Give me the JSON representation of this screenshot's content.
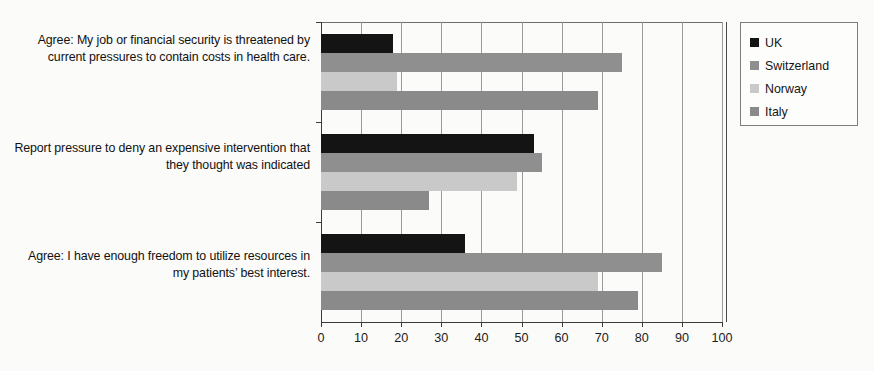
{
  "chart_data": {
    "type": "bar",
    "orientation": "horizontal",
    "title": "",
    "xlabel": "",
    "ylabel": "",
    "xlim": [
      0,
      100
    ],
    "xticks": [
      0,
      10,
      20,
      30,
      40,
      50,
      60,
      70,
      80,
      90,
      100
    ],
    "grid": true,
    "legend_position": "top-right",
    "categories": [
      "Agree: My job or financial security is threatened by current pressures to contain costs in health care.",
      "Report pressure to deny an expensive intervention that they thought was indicated",
      "Agree: I have enough freedom to utilize resources in my patients’ best interest."
    ],
    "series": [
      {
        "name": "UK",
        "color": "#141414",
        "values": [
          18,
          53,
          36
        ]
      },
      {
        "name": "Switzerland",
        "color": "#8f8f8f",
        "values": [
          75,
          55,
          85
        ]
      },
      {
        "name": "Norway",
        "color": "#c9c9c9",
        "values": [
          19,
          49,
          69
        ]
      },
      {
        "name": "Italy",
        "color": "#8a8a8a",
        "values": [
          69,
          27,
          79
        ]
      }
    ]
  }
}
